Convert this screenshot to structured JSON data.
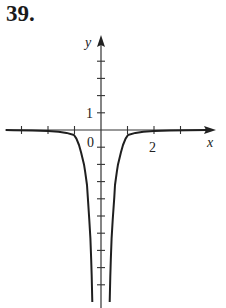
{
  "problem": {
    "number": "39."
  },
  "chart_data": {
    "type": "line",
    "title": "",
    "xlabel": "x",
    "ylabel": "y",
    "x_tick_labels": [
      {
        "value": 2,
        "label": "2"
      }
    ],
    "y_tick_labels": [
      {
        "value": 1,
        "label": "1"
      }
    ],
    "origin_label": "0",
    "x_ticks": [
      -3,
      -2,
      -1,
      1,
      2,
      3
    ],
    "y_ticks": [
      4,
      3,
      2,
      1,
      -1,
      -2,
      -3,
      -4,
      -5,
      -6,
      -7,
      -8,
      -9
    ],
    "xlim": [
      -3.6,
      4.2
    ],
    "ylim": [
      -10.1,
      5.5
    ],
    "grid": false,
    "legend": null,
    "series": [
      {
        "name": "right-branch",
        "points": [
          [
            0.33,
            -10.0
          ],
          [
            0.35,
            -8.5
          ],
          [
            0.37,
            -7.56
          ],
          [
            0.4,
            -6.3
          ],
          [
            0.44,
            -5.23
          ],
          [
            0.5,
            -3.9
          ],
          [
            0.53,
            -3.2
          ],
          [
            0.6,
            -2.4
          ],
          [
            0.64,
            -2.0
          ],
          [
            0.75,
            -1.3
          ],
          [
            0.83,
            -0.87
          ],
          [
            0.93,
            -0.5
          ],
          [
            1.02,
            -0.29
          ],
          [
            1.3,
            -0.17
          ],
          [
            1.6,
            -0.1
          ],
          [
            2.0,
            -0.06
          ],
          [
            2.6,
            -0.03
          ],
          [
            3.3,
            -0.01
          ],
          [
            4.0,
            0.0
          ]
        ]
      },
      {
        "name": "left-branch",
        "points": [
          [
            -0.33,
            -10.0
          ],
          [
            -0.35,
            -8.5
          ],
          [
            -0.37,
            -7.56
          ],
          [
            -0.4,
            -6.3
          ],
          [
            -0.44,
            -5.23
          ],
          [
            -0.5,
            -3.9
          ],
          [
            -0.53,
            -3.2
          ],
          [
            -0.6,
            -2.4
          ],
          [
            -0.64,
            -2.0
          ],
          [
            -0.75,
            -1.3
          ],
          [
            -0.83,
            -0.87
          ],
          [
            -0.93,
            -0.5
          ],
          [
            -1.02,
            -0.29
          ],
          [
            -1.3,
            -0.17
          ],
          [
            -1.6,
            -0.1
          ],
          [
            -2.0,
            -0.06
          ],
          [
            -2.6,
            -0.03
          ],
          [
            -3.3,
            -0.01
          ],
          [
            -3.6,
            0.0
          ]
        ]
      }
    ]
  },
  "style": {
    "axis_color": "#333333",
    "curve_color": "#1f1f1f"
  }
}
